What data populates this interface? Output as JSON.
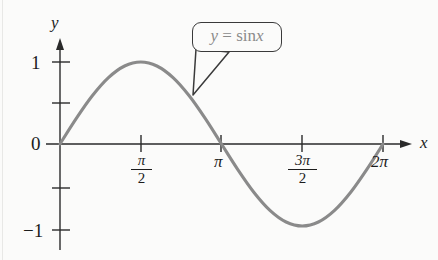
{
  "figure": {
    "background_color": "#fbfbfa",
    "curve_color": "#8a8a8a",
    "axis_color": "#2a2a2a",
    "callout_border_color": "#3a3a3a",
    "callout_text_color": "#8b8b8b"
  },
  "axes": {
    "x_axis_label": "x",
    "y_axis_label": "y",
    "y_ticks": [
      {
        "label": "1",
        "value": 1
      },
      {
        "label": "",
        "value": 0.5
      },
      {
        "label": "0",
        "value": 0
      },
      {
        "label": "",
        "value": -0.5
      },
      {
        "label": "−1",
        "value": -1
      }
    ],
    "x_ticks": [
      {
        "label": "π/2",
        "numerator": "π",
        "denominator": "2",
        "value": 1.5707963
      },
      {
        "label": "π",
        "numerator": "π",
        "denominator": "",
        "value": 3.1415927
      },
      {
        "label": "3π/2",
        "numerator": "3π",
        "denominator": "2",
        "value": 4.712389
      },
      {
        "label": "2π",
        "numerator": "2π",
        "denominator": "",
        "value": 6.2831853
      }
    ]
  },
  "callout": {
    "y_symbol": "y",
    "equals": "=",
    "function_name": "sin",
    "argument": "x",
    "full_text": "y = sin x"
  },
  "chart_data": {
    "type": "line",
    "title": "",
    "subtitle": "",
    "xlabel": "x",
    "ylabel": "y",
    "xlim": [
      0,
      6.2831853
    ],
    "ylim": [
      -1,
      1
    ],
    "grid": false,
    "legend_position": "none",
    "annotations": [
      {
        "text": "y = sin x",
        "style": "rounded-callout-box-with-pointer",
        "points_to_x": 2.26,
        "points_to_y": 0.77
      }
    ],
    "series": [
      {
        "name": "y = sin x",
        "color": "#8a8a8a",
        "x": [
          0,
          0.3141593,
          0.6283185,
          0.9424778,
          1.2566371,
          1.5707963,
          1.8849556,
          2.1991149,
          2.5132741,
          2.8274334,
          3.1415927,
          3.4557519,
          3.7699112,
          4.0840704,
          4.3982297,
          4.712389,
          5.0265482,
          5.3407075,
          5.6548668,
          5.969026,
          6.2831853
        ],
        "y": [
          0,
          0.309017,
          0.587785,
          0.809017,
          0.951057,
          1,
          0.951057,
          0.809017,
          0.587785,
          0.309017,
          0,
          -0.309017,
          -0.587785,
          -0.809017,
          -0.951057,
          -1,
          -0.951057,
          -0.809017,
          -0.587785,
          -0.309017,
          0
        ]
      }
    ],
    "key_points": [
      {
        "x_label": "0",
        "y": 0
      },
      {
        "x_label": "π/2",
        "y": 1
      },
      {
        "x_label": "π",
        "y": 0
      },
      {
        "x_label": "3π/2",
        "y": -1
      },
      {
        "x_label": "2π",
        "y": 0
      }
    ]
  }
}
